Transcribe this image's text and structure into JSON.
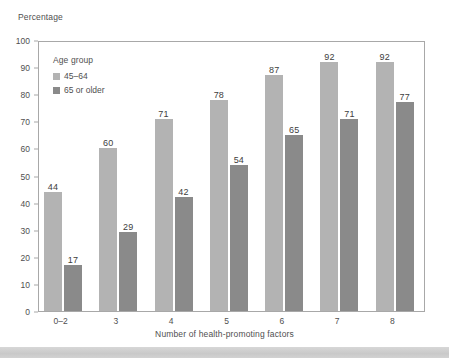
{
  "chart_data": {
    "type": "bar",
    "title": "",
    "ylabel": "Percentage",
    "xlabel": "Number of health-promoting factors",
    "categories": [
      "0–2",
      "3",
      "4",
      "5",
      "6",
      "7",
      "8"
    ],
    "series": [
      {
        "name": "45–64",
        "color": "#b3b3b3",
        "values": [
          44,
          60,
          71,
          78,
          87,
          92,
          92
        ]
      },
      {
        "name": "65 or older",
        "color": "#8a8a8a",
        "values": [
          17,
          29,
          42,
          54,
          65,
          71,
          77
        ]
      }
    ],
    "ylim": [
      0,
      100
    ],
    "yticks": [
      "0",
      "10",
      "20",
      "30",
      "40",
      "50",
      "60",
      "70",
      "80",
      "90",
      "100"
    ],
    "grid": false,
    "legend_position": "inside-top-left",
    "legend_title": "Age group",
    "data_labels": true
  }
}
